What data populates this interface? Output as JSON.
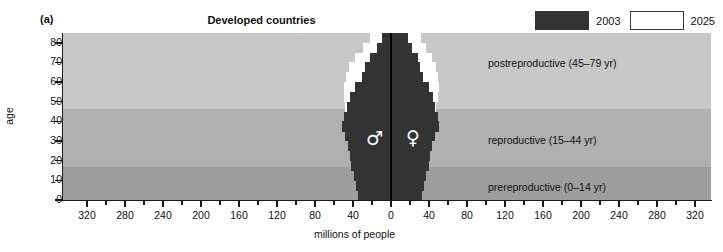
{
  "figure": {
    "panel_letter": "(a)",
    "title": "Developed countries"
  },
  "legend": {
    "items": [
      {
        "label": "2003",
        "color": "#333333",
        "style": "filled"
      },
      {
        "label": "2025",
        "color": "#ffffff",
        "style": "outlined"
      }
    ]
  },
  "axes": {
    "y_title": "age",
    "x_title": "millions of people",
    "y_ticks": [
      "80",
      "70",
      "60",
      "50",
      "40",
      "30",
      "20",
      "10",
      "0"
    ],
    "x_ticks_left": [
      "320",
      "280",
      "240",
      "200",
      "160",
      "120",
      "80",
      "40"
    ],
    "x_tick_center": "0",
    "x_ticks_right": [
      "40",
      "80",
      "120",
      "160",
      "200",
      "240",
      "280",
      "320"
    ]
  },
  "bands": [
    {
      "name": "postreproductive",
      "label": "postreproductive (45–79 yr)",
      "color": "#c8c8c8",
      "age_range": [
        45,
        79
      ]
    },
    {
      "name": "reproductive",
      "label": "reproductive (15–44 yr)",
      "color": "#b0b0b0",
      "age_range": [
        15,
        44
      ]
    },
    {
      "name": "prereproductive",
      "label": "prereproductive (0–14 yr)",
      "color": "#9e9e9e",
      "age_range": [
        0,
        14
      ]
    }
  ],
  "sex_symbols": {
    "male": "♂",
    "female": "♀"
  },
  "chart_data": {
    "type": "bar",
    "subtype": "population-pyramid",
    "title": "Developed countries",
    "xlabel": "millions of people",
    "ylabel": "age",
    "xlim": [
      -340,
      340
    ],
    "ylim": [
      0,
      85
    ],
    "grid": false,
    "legend_position": "top-right",
    "units": "millions of people",
    "age_groups": [
      "0-4",
      "5-9",
      "10-14",
      "15-19",
      "20-24",
      "25-29",
      "30-34",
      "35-39",
      "40-44",
      "45-49",
      "50-54",
      "55-59",
      "60-64",
      "65-69",
      "70-74",
      "75-79",
      "80+"
    ],
    "series": [
      {
        "name": "2003",
        "color": "#333333",
        "male": [
          35,
          37,
          39,
          42,
          43,
          45,
          48,
          52,
          50,
          46,
          43,
          38,
          31,
          27,
          22,
          15,
          10
        ],
        "female": [
          33,
          35,
          37,
          40,
          41,
          43,
          46,
          50,
          49,
          46,
          44,
          40,
          34,
          31,
          28,
          22,
          18
        ]
      },
      {
        "name": "2025",
        "color": "#ffffff",
        "male": [
          33,
          34,
          35,
          37,
          39,
          41,
          43,
          44,
          46,
          48,
          49,
          49,
          47,
          44,
          38,
          30,
          22
        ],
        "female": [
          31,
          32,
          34,
          35,
          37,
          39,
          41,
          43,
          45,
          47,
          49,
          50,
          49,
          47,
          43,
          37,
          32
        ]
      }
    ],
    "bands": [
      {
        "label": "postreproductive (45-79 yr)",
        "age_range": [
          45,
          79
        ]
      },
      {
        "label": "reproductive (15-44 yr)",
        "age_range": [
          15,
          44
        ]
      },
      {
        "label": "prereproductive (0-14 yr)",
        "age_range": [
          0,
          14
        ]
      }
    ]
  }
}
